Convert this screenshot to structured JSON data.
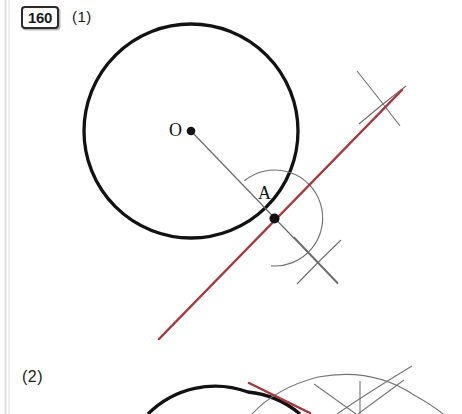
{
  "page": {
    "width": 462,
    "height": 414,
    "background": "#ffffff",
    "paper_edge_color": "#d9d9d9"
  },
  "problem": {
    "number": "160",
    "badge_border_color": "#2b2b2b"
  },
  "items": [
    {
      "label": "(1)"
    },
    {
      "label": "(2)"
    }
  ],
  "labels": {
    "center_point": "O",
    "tangent_point": "A"
  },
  "colors": {
    "circle_stroke": "#111111",
    "construction_stroke": "#6b6b6b",
    "tangent_line": "#a8363a",
    "point_fill": "#111111",
    "text": "#111111"
  },
  "figure_1": {
    "type": "compass-and-straightedge-construction",
    "description": "Tangent to a circle at point A on the circle",
    "circle": {
      "cx": 191,
      "cy": 131,
      "r": 107,
      "stroke_width": 3.2
    },
    "center_point": {
      "x": 191,
      "y": 131,
      "r": 4.2
    },
    "tangent_point": {
      "x": 274,
      "y": 218,
      "r": 4.8
    },
    "radius_line": {
      "x1": 191,
      "y1": 131,
      "x2": 330,
      "y2": 276
    },
    "arc_at_A": {
      "cx": 274,
      "cy": 218,
      "r": 48,
      "start_deg": 128,
      "end_deg": 402
    },
    "arc_upper_right_1": {
      "cx": 310,
      "cy": 182,
      "r": 48,
      "start_deg": 20,
      "end_deg": 95
    },
    "arc_upper_right_2": {
      "cx": 239,
      "cy": 253,
      "r": 48,
      "start_deg": -68,
      "end_deg": 8
    },
    "arc_lower_right_1": {
      "cx": 310,
      "cy": 182,
      "r": 48,
      "start_deg": 62,
      "end_deg": 122
    },
    "arc_lower_right_2": {
      "cx": 239,
      "cy": 253,
      "r": 48,
      "start_deg": -28,
      "end_deg": 30
    },
    "tangent_line": {
      "x1": 159,
      "y1": 338,
      "x2": 401,
      "y2": 91,
      "stroke_width": 2.4
    },
    "perp_guide": {
      "x1": 222,
      "y1": 166,
      "x2": 340,
      "y2": 278
    }
  },
  "figure_2": {
    "type": "compass-and-straightedge-construction",
    "description": "Second construction, cropped at bottom edge of page",
    "circle": {
      "cx": 243,
      "cy": 486,
      "r": 95,
      "stroke_width": 3.2
    },
    "tangent_line": {
      "x1": 249,
      "y1": 384,
      "x2": 311,
      "y2": 413,
      "stroke_width": 2.4
    },
    "arc_big": {
      "cx": 326,
      "cy": 470,
      "r": 74,
      "start_deg": 182,
      "end_deg": 300
    },
    "arc_cross": {
      "cx": 430,
      "cy": 460,
      "r": 78,
      "start_deg": 170,
      "end_deg": 232
    },
    "ray_left": {
      "x1": 318,
      "y1": 387,
      "x2": 360,
      "y2": 414
    },
    "ray_right": {
      "x1": 408,
      "y1": 380,
      "x2": 355,
      "y2": 414
    },
    "ray_vertical": {
      "x1": 362,
      "y1": 382,
      "x2": 362,
      "y2": 414
    }
  }
}
